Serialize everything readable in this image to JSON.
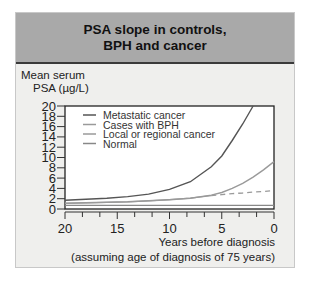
{
  "figure": {
    "title_line1": "PSA slope in controls,",
    "title_line2": "BPH and cancer",
    "ylabel_line1": "Mean serum",
    "ylabel_line2": "PSA (µg/L)",
    "xlabel_line1": "Years before diagnosis",
    "xlabel_line2": "(assuming age of diagnosis of 75 years)"
  },
  "chart_data": {
    "type": "line",
    "title": "PSA slope in controls, BPH and cancer",
    "xlabel": "Years before diagnosis (assuming age of diagnosis of 75 years)",
    "ylabel": "Mean serum PSA (µg/L)",
    "xlim": [
      20,
      0
    ],
    "ylim": [
      0,
      20
    ],
    "x_ticks": [
      20,
      15,
      10,
      5,
      0
    ],
    "y_ticks": [
      0,
      2,
      4,
      6,
      8,
      10,
      12,
      14,
      16,
      18,
      20
    ],
    "grid": false,
    "legend_position": "upper-left inside",
    "x": [
      20,
      18,
      16,
      14,
      12,
      10,
      8,
      6,
      5,
      4,
      3,
      2,
      1,
      0
    ],
    "series": [
      {
        "name": "Metastatic cancer",
        "color": "#555555",
        "style": "solid",
        "values": [
          1.7,
          1.9,
          2.1,
          2.4,
          2.9,
          3.8,
          5.3,
          8.2,
          10.3,
          13.3,
          16.5,
          20,
          null,
          null
        ]
      },
      {
        "name": "Cases with BPH",
        "color": "#9a9a9a",
        "style": "solid",
        "values": [
          1.1,
          1.2,
          1.3,
          1.4,
          1.6,
          1.8,
          2.1,
          2.7,
          3.2,
          4.0,
          5.0,
          6.2,
          7.6,
          9.2
        ]
      },
      {
        "name": "Local or regional cancer",
        "color": "#9a9a9a",
        "style": "solid/dashed (dashed after ~6 years)",
        "values": [
          1.1,
          1.2,
          1.3,
          1.4,
          1.6,
          1.8,
          2.1,
          2.6,
          2.8,
          3.0,
          3.1,
          3.3,
          3.4,
          3.6
        ]
      },
      {
        "name": "Normal",
        "color": "#888888",
        "style": "solid",
        "values": [
          0.7,
          0.7,
          0.7,
          0.7,
          0.7,
          0.7,
          0.7,
          0.7,
          0.7,
          0.7,
          0.7,
          0.7,
          0.7,
          0.7
        ]
      }
    ]
  }
}
